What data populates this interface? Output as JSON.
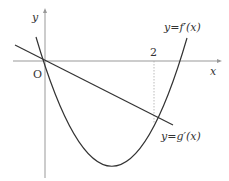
{
  "diagram": {
    "axes": {
      "x_label": "x",
      "y_label": "y",
      "origin_label": "O"
    },
    "tick_labels": {
      "x2": "2"
    },
    "curves": {
      "f_prime_label": "y=f′(x)",
      "g_prime_label": "y=g′(x)"
    },
    "colors": {
      "axis": "#999999",
      "curve": "#333333",
      "dotted": "#aaaaaa"
    }
  }
}
